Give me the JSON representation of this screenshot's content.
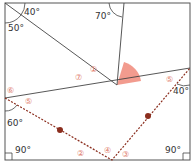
{
  "diagram": {
    "type": "geometry-angle-figure",
    "colors": {
      "line": "#444444",
      "sector": "#f08a7a",
      "dashed": "#8b2e1e",
      "dot": "#8b2e1e",
      "circled_number": "#e07a6a",
      "text": "#333333"
    },
    "angle_labels": [
      {
        "id": "a40-top-left",
        "text": "40°"
      },
      {
        "id": "a50",
        "text": "50°"
      },
      {
        "id": "a70",
        "text": "70°"
      },
      {
        "id": "a40-right",
        "text": "40°"
      },
      {
        "id": "a60",
        "text": "60°"
      },
      {
        "id": "a90-left",
        "text": "90°"
      },
      {
        "id": "a90-right",
        "text": "90°"
      }
    ],
    "circled_numbers": [
      {
        "id": "n1",
        "text": "①"
      },
      {
        "id": "n7",
        "text": "⑦"
      },
      {
        "id": "n6",
        "text": "⑥"
      },
      {
        "id": "n5-left",
        "text": "⑤"
      },
      {
        "id": "n5-right",
        "text": "⑤"
      },
      {
        "id": "n2",
        "text": "②"
      },
      {
        "id": "n4",
        "text": "④"
      },
      {
        "id": "n3",
        "text": "③"
      }
    ]
  }
}
